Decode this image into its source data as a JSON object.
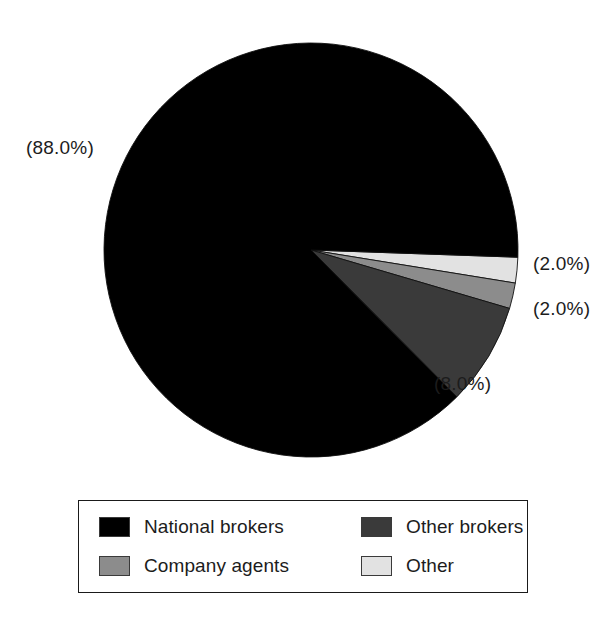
{
  "chart_data": {
    "type": "pie",
    "title": "",
    "subtitle": "",
    "xlabel": "",
    "ylabel": "",
    "legend_position": "bottom",
    "grid": false,
    "start_angle_deg": 2,
    "direction": "clockwise",
    "categories": [
      "National brokers",
      "Other brokers",
      "Company agents",
      "Other"
    ],
    "values": [
      88.0,
      8.0,
      2.0,
      2.0
    ],
    "slices": [
      {
        "label": "National brokers",
        "value": 88.0,
        "display": "(88.0%)",
        "color": "#000000",
        "order": 4
      },
      {
        "label": "Other",
        "value": 2.0,
        "display": "(2.0%)",
        "color": "#e2e2e2",
        "order": 1
      },
      {
        "label": "Company agents",
        "value": 2.0,
        "display": "(2.0%)",
        "color": "#8c8c8c",
        "order": 2
      },
      {
        "label": "Other brokers",
        "value": 8.0,
        "display": "(8.0%)",
        "color": "#3a3a3a",
        "order": 3
      }
    ],
    "data_labels": [
      "(88.0%)",
      "(2.0%)",
      "(2.0%)",
      "(8.0%)"
    ]
  },
  "labels": {
    "national_brokers_pct": "(88.0%)",
    "other_pct": "(2.0%)",
    "company_agents_pct": "(2.0%)",
    "other_brokers_pct": "(8.0%)"
  },
  "legend": {
    "entries": [
      {
        "label": "National brokers",
        "color": "#000000"
      },
      {
        "label": "Other brokers",
        "color": "#3a3a3a"
      },
      {
        "label": "Company agents",
        "color": "#8c8c8c"
      },
      {
        "label": "Other",
        "color": "#e2e2e2"
      }
    ]
  },
  "colors": {
    "national_brokers": "#000000",
    "other_brokers": "#3a3a3a",
    "company_agents": "#8c8c8c",
    "other": "#e2e2e2",
    "background": "#ffffff",
    "text": "#1c1c1c",
    "border": "#1a1a1a"
  }
}
